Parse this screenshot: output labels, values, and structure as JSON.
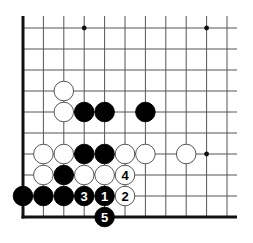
{
  "diagram": {
    "type": "go-board-fragment",
    "grid": {
      "cols": 11,
      "rows": 10,
      "origin_x": 23,
      "origin_y": 28,
      "spacing_x": 20.4,
      "spacing_y": 21,
      "top_extent": 16,
      "right_extent": 237,
      "left_edge_thick": true,
      "bottom_edge_thick": true,
      "bottom_edge_row": 9
    },
    "colors": {
      "line": "#555555",
      "edge": "#111111",
      "black_stone": "#000000",
      "white_stone": "#ffffff",
      "white_outline": "#444444",
      "star": "#111111"
    },
    "star_points": [
      {
        "col": 3,
        "row": 0
      },
      {
        "col": 9,
        "row": 0
      },
      {
        "col": 9,
        "row": 6
      }
    ],
    "stones": [
      {
        "col": 2,
        "row": 3,
        "color": "white",
        "label": ""
      },
      {
        "col": 2,
        "row": 4,
        "color": "white",
        "label": ""
      },
      {
        "col": 3,
        "row": 4,
        "color": "black",
        "label": ""
      },
      {
        "col": 4,
        "row": 4,
        "color": "black",
        "label": ""
      },
      {
        "col": 6,
        "row": 4,
        "color": "black",
        "label": ""
      },
      {
        "col": 1,
        "row": 6,
        "color": "white",
        "label": ""
      },
      {
        "col": 2,
        "row": 6,
        "color": "white",
        "label": ""
      },
      {
        "col": 3,
        "row": 6,
        "color": "black",
        "label": ""
      },
      {
        "col": 4,
        "row": 6,
        "color": "black",
        "label": ""
      },
      {
        "col": 5,
        "row": 6,
        "color": "white",
        "label": ""
      },
      {
        "col": 6,
        "row": 6,
        "color": "white",
        "label": ""
      },
      {
        "col": 8,
        "row": 6,
        "color": "white",
        "label": ""
      },
      {
        "col": 1,
        "row": 7,
        "color": "white",
        "label": ""
      },
      {
        "col": 2,
        "row": 7,
        "color": "black",
        "label": ""
      },
      {
        "col": 3,
        "row": 7,
        "color": "white",
        "label": ""
      },
      {
        "col": 4,
        "row": 7,
        "color": "white",
        "label": ""
      },
      {
        "col": 5,
        "row": 7,
        "color": "white",
        "label": "4"
      },
      {
        "col": 0,
        "row": 8,
        "color": "black",
        "label": ""
      },
      {
        "col": 1,
        "row": 8,
        "color": "black",
        "label": ""
      },
      {
        "col": 2,
        "row": 8,
        "color": "black",
        "label": ""
      },
      {
        "col": 3,
        "row": 8,
        "color": "black",
        "label": "3"
      },
      {
        "col": 4,
        "row": 8,
        "color": "black",
        "label": "1"
      },
      {
        "col": 5,
        "row": 8,
        "color": "white",
        "label": "2"
      },
      {
        "col": 4,
        "row": 9,
        "color": "black",
        "label": "5"
      }
    ]
  }
}
